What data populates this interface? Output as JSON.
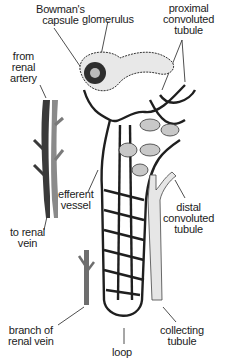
{
  "diagram": {
    "labels": {
      "bowmans_capsule": [
        "Bowman's",
        "capsule"
      ],
      "glomerulus": [
        "glomerulus"
      ],
      "proximal_convoluted_tubule": [
        "proximal",
        "convoluted",
        "tubule"
      ],
      "from_renal_artery": [
        "from",
        "renal",
        "artery"
      ],
      "efferent_vessel": [
        "efferent",
        "vessel"
      ],
      "to_renal_vein": [
        "to renal",
        "vein"
      ],
      "distal_convoluted_tubule": [
        "distal",
        "convoluted",
        "tubule"
      ],
      "branch_of_renal_vein": [
        "branch of",
        "renal vein"
      ],
      "collecting_tubule": [
        "collecting",
        "tubule"
      ],
      "loop": [
        "loop"
      ]
    },
    "colors": {
      "ink": "#1a1a1a",
      "vessel_dark": "#2a2a2a",
      "vein_gray": "#6e6e6e",
      "tubule_light": "#d9d9d9",
      "background": "#ffffff"
    }
  }
}
